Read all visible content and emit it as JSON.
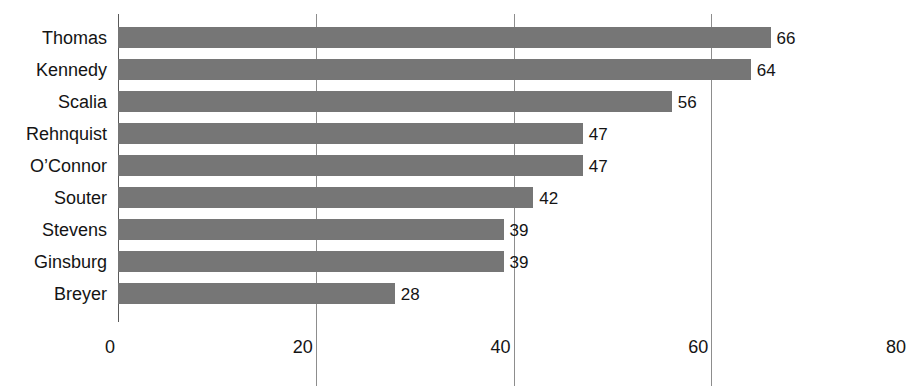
{
  "chart_data": {
    "type": "bar",
    "orientation": "horizontal",
    "title": "",
    "subtitle": "",
    "xlabel": "",
    "ylabel": "",
    "categories": [
      "Thomas",
      "Kennedy",
      "Scalia",
      "Rehnquist",
      "O’Connor",
      "Souter",
      "Stevens",
      "Ginsburg",
      "Breyer"
    ],
    "values": [
      66,
      64,
      56,
      47,
      47,
      42,
      39,
      39,
      28
    ],
    "value_labels": [
      "66",
      "64",
      "56",
      "47",
      "47",
      "42",
      "39",
      "39",
      "28"
    ],
    "xlim": [
      0,
      80
    ],
    "x_ticks": [
      0,
      20,
      40,
      60,
      80
    ],
    "x_tick_labels": [
      "0",
      "20",
      "40",
      "60",
      "80"
    ],
    "gridlines_at": [
      20,
      40,
      60
    ],
    "grid": true,
    "legend": false,
    "legend_position": "none",
    "bar_color": "#767676",
    "grid_color": "#8d8d8d",
    "axis_color": "#5a5a5a",
    "text_color": "#141414",
    "background_color": "#ffffff"
  },
  "bars": [
    {
      "label": "Thomas",
      "value": 66,
      "value_text": "66"
    },
    {
      "label": "Kennedy",
      "value": 64,
      "value_text": "64"
    },
    {
      "label": "Scalia",
      "value": 56,
      "value_text": "56"
    },
    {
      "label": "Rehnquist",
      "value": 47,
      "value_text": "47"
    },
    {
      "label": "O’Connor",
      "value": 47,
      "value_text": "47"
    },
    {
      "label": "Souter",
      "value": 42,
      "value_text": "42"
    },
    {
      "label": "Stevens",
      "value": 39,
      "value_text": "39"
    },
    {
      "label": "Ginsburg",
      "value": 39,
      "value_text": "39"
    },
    {
      "label": "Breyer",
      "value": 28,
      "value_text": "28"
    }
  ],
  "x_axis": {
    "ticks": [
      {
        "value": 0,
        "label": "0"
      },
      {
        "value": 20,
        "label": "20"
      },
      {
        "value": 40,
        "label": "40"
      },
      {
        "value": 60,
        "label": "60"
      },
      {
        "value": 80,
        "label": "80"
      }
    ]
  }
}
